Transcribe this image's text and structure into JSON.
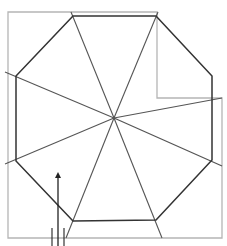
{
  "diagram": {
    "colors": {
      "octagon_stroke": "#333333",
      "spoke_stroke": "#555555",
      "outline_stroke": "#b5b5b5",
      "arrow": "#222222",
      "background": "#ffffff"
    },
    "center": [
      114,
      118
    ],
    "octagon_vertices": [
      [
        73,
        16
      ],
      [
        156,
        16
      ],
      [
        212,
        76
      ],
      [
        212,
        160
      ],
      [
        156,
        220
      ],
      [
        73,
        221
      ],
      [
        16,
        161
      ],
      [
        16,
        76
      ]
    ],
    "spoke_ends": [
      [
        71,
        12
      ],
      [
        158,
        12
      ],
      [
        222,
        98
      ],
      [
        222,
        166
      ],
      [
        162,
        238
      ],
      [
        66,
        238
      ],
      [
        5,
        164
      ],
      [
        5,
        72
      ]
    ],
    "outline_path": "M8,12 L157,12 L157,98 L222,98 L222,238 L8,238 Z",
    "arrow": {
      "x": 58,
      "y_start": 246,
      "y_end": 172
    },
    "tick_marks": [
      {
        "x": 52,
        "y1": 228,
        "y2": 246
      },
      {
        "x": 64,
        "y1": 228,
        "y2": 246
      }
    ]
  }
}
